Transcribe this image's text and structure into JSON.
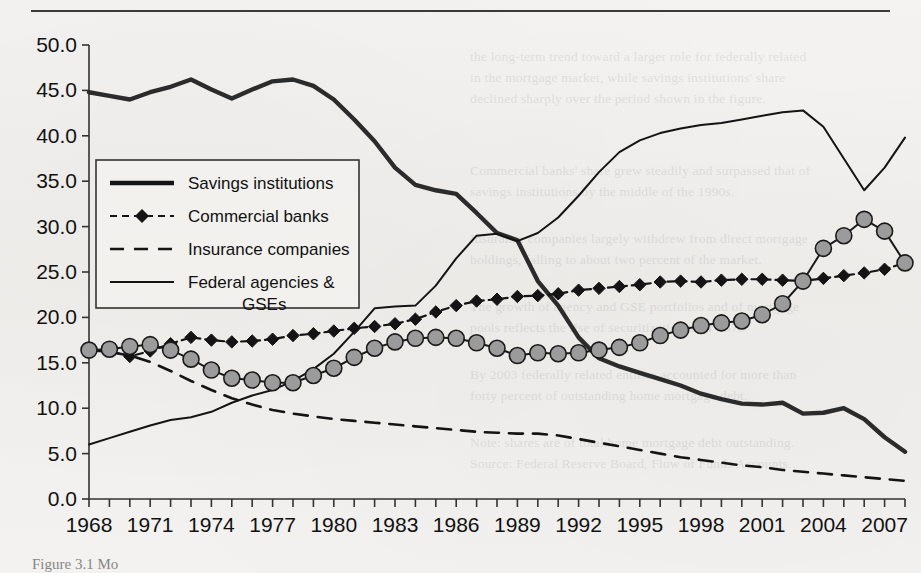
{
  "figure": {
    "caption": "Figure 3.1  Mo",
    "top_rule": true
  },
  "chart_data": {
    "type": "line",
    "title": "",
    "xlabel": "",
    "ylabel": "",
    "xlim": [
      1968,
      2008
    ],
    "ylim": [
      0.0,
      50.0
    ],
    "ytick_step": 5.0,
    "xtick_step": 1,
    "xtick_label_step": 3,
    "grid": false,
    "legend_position": "upper-left-inside",
    "yticks": [
      "0.0",
      "5.0",
      "10.0",
      "15.0",
      "20.0",
      "25.0",
      "30.0",
      "35.0",
      "40.0",
      "45.0",
      "50.0"
    ],
    "x": [
      1968,
      1969,
      1970,
      1971,
      1972,
      1973,
      1974,
      1975,
      1976,
      1977,
      1978,
      1979,
      1980,
      1981,
      1982,
      1983,
      1984,
      1985,
      1986,
      1987,
      1988,
      1989,
      1990,
      1991,
      1992,
      1993,
      1994,
      1995,
      1996,
      1997,
      1998,
      1999,
      2000,
      2001,
      2002,
      2003,
      2004,
      2005,
      2006,
      2007,
      2008
    ],
    "xticklabels": [
      "1968",
      "1971",
      "1974",
      "1977",
      "1980",
      "1983",
      "1986",
      "1989",
      "1992",
      "1995",
      "1998",
      "2001",
      "2004",
      "2007"
    ],
    "series": [
      {
        "name": "Savings institutions",
        "style": "solid-thick",
        "color": "#2b2b2b",
        "marker": "none",
        "values": [
          44.8,
          44.4,
          44.0,
          44.8,
          45.4,
          46.2,
          45.1,
          44.1,
          45.1,
          46.0,
          46.2,
          45.5,
          44.0,
          41.8,
          39.4,
          36.5,
          34.6,
          34.0,
          33.6,
          31.5,
          29.3,
          28.5,
          24.0,
          21.3,
          17.8,
          15.5,
          14.6,
          13.9,
          13.2,
          12.5,
          11.6,
          11.0,
          10.5,
          10.4,
          10.6,
          9.4,
          9.5,
          10.0,
          8.8,
          6.8,
          5.2
        ]
      },
      {
        "name": "Commercial banks",
        "style": "dashed-marker",
        "color": "#141414",
        "marker": "diamond",
        "values": [
          16.4,
          16.3,
          15.7,
          16.3,
          17.1,
          17.8,
          17.5,
          17.3,
          17.4,
          17.6,
          18.0,
          18.2,
          18.5,
          18.8,
          19.0,
          19.3,
          19.8,
          20.6,
          21.3,
          21.8,
          22.0,
          22.3,
          22.4,
          22.6,
          23.0,
          23.2,
          23.4,
          23.6,
          23.9,
          24.0,
          23.9,
          24.1,
          24.2,
          24.2,
          24.1,
          24.0,
          24.3,
          24.6,
          24.9,
          25.3,
          26.0
        ]
      },
      {
        "name": "Insurance companies",
        "style": "dashed",
        "color": "#141414",
        "marker": "none",
        "values": [
          16.4,
          16.2,
          15.8,
          15.1,
          14.1,
          13.0,
          12.0,
          11.1,
          10.4,
          9.8,
          9.4,
          9.1,
          8.8,
          8.6,
          8.4,
          8.2,
          8.0,
          7.8,
          7.6,
          7.4,
          7.3,
          7.2,
          7.2,
          7.0,
          6.6,
          6.2,
          5.8,
          5.4,
          5.0,
          4.6,
          4.3,
          4.0,
          3.7,
          3.5,
          3.2,
          3.0,
          2.8,
          2.6,
          2.4,
          2.2,
          2.0
        ]
      },
      {
        "name": "Federal agencies & GSEs",
        "style": "solid-thin",
        "color": "#141414",
        "marker": "none",
        "values": [
          6.0,
          6.7,
          7.4,
          8.1,
          8.7,
          9.0,
          9.6,
          10.6,
          11.4,
          12.0,
          13.0,
          14.3,
          16.0,
          18.4,
          21.0,
          21.2,
          21.3,
          23.5,
          26.5,
          29.0,
          29.2,
          28.4,
          29.3,
          31.0,
          33.4,
          36.0,
          38.2,
          39.5,
          40.3,
          40.8,
          41.2,
          41.4,
          41.8,
          42.2,
          42.6,
          42.8,
          41.0,
          37.5,
          34.0,
          36.5,
          39.8
        ]
      },
      {
        "name": "",
        "style": "solid-marker",
        "color": "#1a1a1a",
        "marker": "circle-gray",
        "marker_fill": "#9b9b9b",
        "values": [
          16.4,
          16.5,
          16.8,
          17.0,
          16.4,
          15.4,
          14.2,
          13.3,
          13.1,
          12.8,
          12.8,
          13.6,
          14.4,
          15.6,
          16.6,
          17.3,
          17.7,
          17.8,
          17.7,
          17.2,
          16.6,
          15.8,
          16.1,
          16.0,
          16.1,
          16.4,
          16.7,
          17.2,
          18.0,
          18.6,
          19.1,
          19.4,
          19.6,
          20.3,
          21.5,
          24.0,
          27.6,
          29.0,
          30.8,
          29.5,
          26.0
        ]
      }
    ],
    "legend_entries": [
      {
        "label": "Savings institutions",
        "style": "solid-thick",
        "marker": "none"
      },
      {
        "label": "Commercial banks",
        "style": "dashed-marker",
        "marker": "diamond"
      },
      {
        "label": "Insurance companies",
        "style": "dashed",
        "marker": "none"
      },
      {
        "label": "Federal agencies &",
        "label2": "GSEs",
        "style": "solid-thin",
        "marker": "none"
      }
    ]
  },
  "ghost_lines": [
    {
      "t": "the long-term trend toward a larger role for federally related",
      "x": 470,
      "y": 46
    },
    {
      "t": "in the mortgage market, while savings institutions' share",
      "x": 470,
      "y": 67
    },
    {
      "t": "declined sharply over the period shown in the figure.",
      "x": 470,
      "y": 88
    },
    {
      "t": "Commercial banks' share grew steadily and surpassed that of",
      "x": 470,
      "y": 160
    },
    {
      "t": "savings institutions by the middle of the 1990s.",
      "x": 470,
      "y": 181
    },
    {
      "t": "Insurance companies largely withdrew from direct mortgage",
      "x": 470,
      "y": 228
    },
    {
      "t": "holdings, falling to about two percent of the market.",
      "x": 470,
      "y": 249
    },
    {
      "t": "The growth of agency and GSE portfolios and of mortgage",
      "x": 470,
      "y": 296
    },
    {
      "t": "pools reflects the rise of securitization after 1970.",
      "x": 470,
      "y": 317
    },
    {
      "t": "By 2003 federally related entities accounted for more than",
      "x": 470,
      "y": 364
    },
    {
      "t": "forty percent of outstanding home mortgage debt.",
      "x": 470,
      "y": 385
    },
    {
      "t": "Note: shares are of total home mortgage debt outstanding.",
      "x": 470,
      "y": 432
    },
    {
      "t": "Source: Federal Reserve Board, Flow of Funds Accounts.",
      "x": 470,
      "y": 453
    }
  ]
}
